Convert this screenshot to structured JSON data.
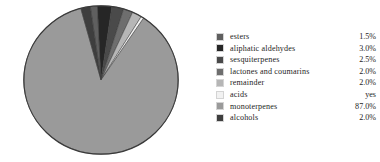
{
  "chart_data": {
    "type": "pie",
    "title": "",
    "subtitle": "",
    "xlabel": "",
    "ylabel": "",
    "legend_position": "right",
    "grid": false,
    "categories": [
      "esters",
      "aliphatic aldehydes",
      "sesquiterpenes",
      "lactones and coumarins",
      "remainder",
      "acids",
      "monoterpenes",
      "alcohols"
    ],
    "values": [
      1.5,
      3.0,
      2.5,
      2.0,
      2.0,
      0,
      87.0,
      2.0
    ],
    "value_labels": [
      "1.5%",
      "3.0%",
      "2.5%",
      "2.0%",
      "2.0%",
      "yes",
      "87.0%",
      "2.0%"
    ],
    "colors": [
      "#5f5f5f",
      "#262626",
      "#4a4a4a",
      "#6e6e6e",
      "#b6b6b6",
      "#f2f2f2",
      "#9a9a9a",
      "#3e3e3e"
    ],
    "slice_outline_color": "#3a3a3a",
    "start_angle_deg": -8,
    "units": "percent"
  },
  "legend": {
    "rows": [
      {
        "label": "esters",
        "value": "1.5%",
        "swatch": "#5f5f5f"
      },
      {
        "label": "aliphatic aldehydes",
        "value": "3.0%",
        "swatch": "#262626"
      },
      {
        "label": "sesquiterpenes",
        "value": "2.5%",
        "swatch": "#4a4a4a"
      },
      {
        "label": "lactones and coumarins",
        "value": "2.0%",
        "swatch": "#6e6e6e"
      },
      {
        "label": "remainder",
        "value": "2.0%",
        "swatch": "#b6b6b6"
      },
      {
        "label": "acids",
        "value": "yes",
        "swatch": "#f2f2f2"
      },
      {
        "label": "monoterpenes",
        "value": "87.0%",
        "swatch": "#9a9a9a"
      },
      {
        "label": "alcohols",
        "value": "2.0%",
        "swatch": "#3e3e3e"
      }
    ]
  }
}
